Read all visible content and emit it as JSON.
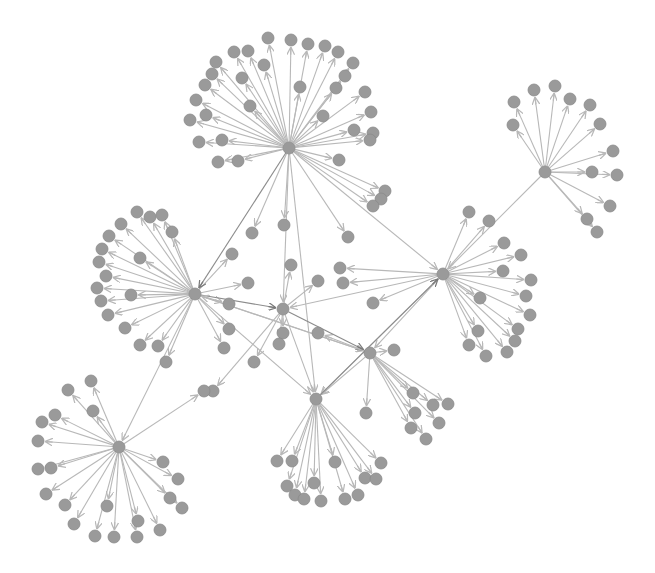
{
  "graph": {
    "type": "directed-network",
    "background": "#ffffff",
    "colors": {
      "node_fill": "#9a9a9a",
      "node_stroke": "#8a8a8a",
      "edge": "#b8b8b8",
      "edge_dark": "#8c8c8c"
    },
    "node_radius": 6,
    "hubs": [
      {
        "id": "h1",
        "x": 289,
        "y": 148
      },
      {
        "id": "h2",
        "x": 545,
        "y": 172
      },
      {
        "id": "h3",
        "x": 195,
        "y": 294
      },
      {
        "id": "h4",
        "x": 443,
        "y": 274
      },
      {
        "id": "h5",
        "x": 283,
        "y": 309
      },
      {
        "id": "h6",
        "x": 370,
        "y": 353
      },
      {
        "id": "h7",
        "x": 316,
        "y": 399
      },
      {
        "id": "h8",
        "x": 119,
        "y": 447
      }
    ],
    "leaves": [
      {
        "hub": "h1",
        "x": 268,
        "y": 38
      },
      {
        "hub": "h1",
        "x": 291,
        "y": 40
      },
      {
        "hub": "h1",
        "x": 308,
        "y": 44
      },
      {
        "hub": "h1",
        "x": 325,
        "y": 46
      },
      {
        "hub": "h1",
        "x": 338,
        "y": 52
      },
      {
        "hub": "h1",
        "x": 248,
        "y": 51
      },
      {
        "hub": "h1",
        "x": 234,
        "y": 52
      },
      {
        "hub": "h1",
        "x": 216,
        "y": 62
      },
      {
        "hub": "h1",
        "x": 264,
        "y": 65
      },
      {
        "hub": "h1",
        "x": 353,
        "y": 63
      },
      {
        "hub": "h1",
        "x": 345,
        "y": 76
      },
      {
        "hub": "h1",
        "x": 212,
        "y": 74
      },
      {
        "hub": "h1",
        "x": 205,
        "y": 85
      },
      {
        "hub": "h1",
        "x": 242,
        "y": 78
      },
      {
        "hub": "h1",
        "x": 365,
        "y": 92
      },
      {
        "hub": "h1",
        "x": 336,
        "y": 88
      },
      {
        "hub": "h1",
        "x": 196,
        "y": 100
      },
      {
        "hub": "h1",
        "x": 206,
        "y": 115
      },
      {
        "hub": "h1",
        "x": 250,
        "y": 106
      },
      {
        "hub": "h1",
        "x": 371,
        "y": 112
      },
      {
        "hub": "h1",
        "x": 373,
        "y": 133
      },
      {
        "hub": "h1",
        "x": 190,
        "y": 120
      },
      {
        "hub": "h1",
        "x": 323,
        "y": 116
      },
      {
        "hub": "h1",
        "x": 354,
        "y": 130
      },
      {
        "hub": "h1",
        "x": 199,
        "y": 142
      },
      {
        "hub": "h1",
        "x": 222,
        "y": 140
      },
      {
        "hub": "h1",
        "x": 370,
        "y": 140
      },
      {
        "hub": "h1",
        "x": 218,
        "y": 162
      },
      {
        "hub": "h1",
        "x": 238,
        "y": 161
      },
      {
        "hub": "h1",
        "x": 339,
        "y": 160
      },
      {
        "hub": "h1",
        "x": 300,
        "y": 87
      },
      {
        "hub": "h1",
        "x": 385,
        "y": 191
      },
      {
        "hub": "h1",
        "x": 381,
        "y": 199
      },
      {
        "hub": "h1",
        "x": 373,
        "y": 206
      },
      {
        "hub": "h1",
        "x": 284,
        "y": 225
      },
      {
        "hub": "h1",
        "x": 252,
        "y": 233
      },
      {
        "hub": "h1",
        "x": 348,
        "y": 237
      },
      {
        "hub": "h2",
        "x": 534,
        "y": 90
      },
      {
        "hub": "h2",
        "x": 555,
        "y": 86
      },
      {
        "hub": "h2",
        "x": 514,
        "y": 102
      },
      {
        "hub": "h2",
        "x": 570,
        "y": 99
      },
      {
        "hub": "h2",
        "x": 590,
        "y": 105
      },
      {
        "hub": "h2",
        "x": 513,
        "y": 125
      },
      {
        "hub": "h2",
        "x": 600,
        "y": 124
      },
      {
        "hub": "h2",
        "x": 613,
        "y": 151
      },
      {
        "hub": "h2",
        "x": 592,
        "y": 172
      },
      {
        "hub": "h2",
        "x": 617,
        "y": 175
      },
      {
        "hub": "h2",
        "x": 610,
        "y": 206
      },
      {
        "hub": "h2",
        "x": 587,
        "y": 219
      },
      {
        "hub": "h2",
        "x": 597,
        "y": 232
      },
      {
        "hub": "h3",
        "x": 137,
        "y": 212
      },
      {
        "hub": "h3",
        "x": 150,
        "y": 217
      },
      {
        "hub": "h3",
        "x": 162,
        "y": 215
      },
      {
        "hub": "h3",
        "x": 121,
        "y": 224
      },
      {
        "hub": "h3",
        "x": 172,
        "y": 232
      },
      {
        "hub": "h3",
        "x": 109,
        "y": 236
      },
      {
        "hub": "h3",
        "x": 102,
        "y": 249
      },
      {
        "hub": "h3",
        "x": 99,
        "y": 262
      },
      {
        "hub": "h3",
        "x": 140,
        "y": 258
      },
      {
        "hub": "h3",
        "x": 106,
        "y": 276
      },
      {
        "hub": "h3",
        "x": 97,
        "y": 288
      },
      {
        "hub": "h3",
        "x": 131,
        "y": 295
      },
      {
        "hub": "h3",
        "x": 101,
        "y": 301
      },
      {
        "hub": "h3",
        "x": 108,
        "y": 315
      },
      {
        "hub": "h3",
        "x": 125,
        "y": 328
      },
      {
        "hub": "h3",
        "x": 140,
        "y": 345
      },
      {
        "hub": "h3",
        "x": 158,
        "y": 346
      },
      {
        "hub": "h3",
        "x": 166,
        "y": 362
      },
      {
        "hub": "h3",
        "x": 232,
        "y": 254
      },
      {
        "hub": "h3",
        "x": 229,
        "y": 304
      },
      {
        "hub": "h3",
        "x": 229,
        "y": 329
      },
      {
        "hub": "h3",
        "x": 224,
        "y": 348
      },
      {
        "hub": "h3",
        "x": 248,
        "y": 283
      },
      {
        "hub": "h4",
        "x": 469,
        "y": 212
      },
      {
        "hub": "h4",
        "x": 489,
        "y": 221
      },
      {
        "hub": "h4",
        "x": 504,
        "y": 243
      },
      {
        "hub": "h4",
        "x": 521,
        "y": 255
      },
      {
        "hub": "h4",
        "x": 503,
        "y": 271
      },
      {
        "hub": "h4",
        "x": 531,
        "y": 280
      },
      {
        "hub": "h4",
        "x": 480,
        "y": 298
      },
      {
        "hub": "h4",
        "x": 526,
        "y": 296
      },
      {
        "hub": "h4",
        "x": 530,
        "y": 315
      },
      {
        "hub": "h4",
        "x": 518,
        "y": 329
      },
      {
        "hub": "h4",
        "x": 478,
        "y": 331
      },
      {
        "hub": "h4",
        "x": 515,
        "y": 341
      },
      {
        "hub": "h4",
        "x": 469,
        "y": 345
      },
      {
        "hub": "h4",
        "x": 507,
        "y": 352
      },
      {
        "hub": "h4",
        "x": 486,
        "y": 356
      },
      {
        "hub": "h4",
        "x": 343,
        "y": 283
      },
      {
        "hub": "h4",
        "x": 373,
        "y": 303
      },
      {
        "hub": "h4",
        "x": 340,
        "y": 268
      },
      {
        "hub": "h5",
        "x": 291,
        "y": 265
      },
      {
        "hub": "h5",
        "x": 318,
        "y": 281
      },
      {
        "hub": "h5",
        "x": 283,
        "y": 333
      },
      {
        "hub": "h5",
        "x": 279,
        "y": 344
      },
      {
        "hub": "h5",
        "x": 254,
        "y": 362
      },
      {
        "hub": "h5",
        "x": 213,
        "y": 391
      },
      {
        "hub": "h6",
        "x": 394,
        "y": 350
      },
      {
        "hub": "h6",
        "x": 366,
        "y": 413
      },
      {
        "hub": "h6",
        "x": 413,
        "y": 393
      },
      {
        "hub": "h6",
        "x": 433,
        "y": 405
      },
      {
        "hub": "h6",
        "x": 415,
        "y": 413
      },
      {
        "hub": "h6",
        "x": 439,
        "y": 423
      },
      {
        "hub": "h6",
        "x": 411,
        "y": 428
      },
      {
        "hub": "h6",
        "x": 426,
        "y": 439
      },
      {
        "hub": "h6",
        "x": 448,
        "y": 404
      },
      {
        "hub": "h6",
        "x": 318,
        "y": 333
      },
      {
        "hub": "h7",
        "x": 277,
        "y": 461
      },
      {
        "hub": "h7",
        "x": 292,
        "y": 461
      },
      {
        "hub": "h7",
        "x": 335,
        "y": 462
      },
      {
        "hub": "h7",
        "x": 381,
        "y": 463
      },
      {
        "hub": "h7",
        "x": 287,
        "y": 486
      },
      {
        "hub": "h7",
        "x": 314,
        "y": 483
      },
      {
        "hub": "h7",
        "x": 365,
        "y": 478
      },
      {
        "hub": "h7",
        "x": 376,
        "y": 479
      },
      {
        "hub": "h7",
        "x": 295,
        "y": 495
      },
      {
        "hub": "h7",
        "x": 321,
        "y": 501
      },
      {
        "hub": "h7",
        "x": 345,
        "y": 499
      },
      {
        "hub": "h7",
        "x": 358,
        "y": 495
      },
      {
        "hub": "h7",
        "x": 304,
        "y": 499
      },
      {
        "hub": "h8",
        "x": 68,
        "y": 390
      },
      {
        "hub": "h8",
        "x": 91,
        "y": 381
      },
      {
        "hub": "h8",
        "x": 55,
        "y": 415
      },
      {
        "hub": "h8",
        "x": 93,
        "y": 411
      },
      {
        "hub": "h8",
        "x": 42,
        "y": 422
      },
      {
        "hub": "h8",
        "x": 38,
        "y": 441
      },
      {
        "hub": "h8",
        "x": 38,
        "y": 469
      },
      {
        "hub": "h8",
        "x": 51,
        "y": 468
      },
      {
        "hub": "h8",
        "x": 46,
        "y": 494
      },
      {
        "hub": "h8",
        "x": 65,
        "y": 505
      },
      {
        "hub": "h8",
        "x": 74,
        "y": 524
      },
      {
        "hub": "h8",
        "x": 163,
        "y": 462
      },
      {
        "hub": "h8",
        "x": 178,
        "y": 479
      },
      {
        "hub": "h8",
        "x": 170,
        "y": 498
      },
      {
        "hub": "h8",
        "x": 182,
        "y": 508
      },
      {
        "hub": "h8",
        "x": 107,
        "y": 506
      },
      {
        "hub": "h8",
        "x": 95,
        "y": 536
      },
      {
        "hub": "h8",
        "x": 114,
        "y": 537
      },
      {
        "hub": "h8",
        "x": 138,
        "y": 521
      },
      {
        "hub": "h8",
        "x": 137,
        "y": 537
      },
      {
        "hub": "h8",
        "x": 160,
        "y": 530
      },
      {
        "hub": "h8",
        "x": 204,
        "y": 391
      }
    ],
    "hub_links": [
      {
        "from": "h1",
        "to": "h3",
        "dark": true
      },
      {
        "from": "h1",
        "to": "h5",
        "dark": false
      },
      {
        "from": "h1",
        "to": "h4",
        "dark": false
      },
      {
        "from": "h1",
        "to": "h7",
        "dark": false
      },
      {
        "from": "h2",
        "to": "h4",
        "dark": false
      },
      {
        "from": "h3",
        "to": "h5",
        "dark": true
      },
      {
        "from": "h3",
        "to": "h8",
        "dark": false
      },
      {
        "from": "h3",
        "to": "h6",
        "dark": false
      },
      {
        "from": "h3",
        "to": "h7",
        "dark": false
      },
      {
        "from": "h4",
        "to": "h5",
        "dark": false
      },
      {
        "from": "h4",
        "to": "h6",
        "dark": false
      },
      {
        "from": "h4",
        "to": "h7",
        "dark": false
      },
      {
        "from": "h5",
        "to": "h6",
        "dark": true
      },
      {
        "from": "h5",
        "to": "h7",
        "dark": false
      },
      {
        "from": "h6",
        "to": "h7",
        "dark": false
      },
      {
        "from": "h6",
        "to": "h3",
        "dark": false
      },
      {
        "from": "h7",
        "to": "h4",
        "dark": true
      }
    ]
  }
}
